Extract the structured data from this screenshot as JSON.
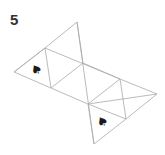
{
  "figure": {
    "number_label": "5",
    "line_color": "#aaaaaa",
    "symbol_color": "#1a1a1a",
    "symbols": [
      {
        "name": "spade",
        "glyph": "♠",
        "x": 36,
        "y": 69,
        "rotate": -30
      },
      {
        "name": "spade",
        "glyph": "♠",
        "x": 102,
        "y": 121,
        "rotate": -30
      }
    ]
  }
}
